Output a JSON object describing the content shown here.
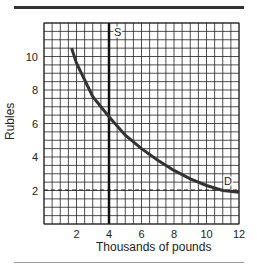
{
  "chart_data": {
    "type": "line",
    "title": "",
    "xlabel": "Thousands of pounds",
    "ylabel": "Rubles",
    "xlim": [
      0,
      12
    ],
    "ylim": [
      0,
      12
    ],
    "grid": true,
    "grid_step": 0.5,
    "x_ticks": [
      2,
      4,
      6,
      8,
      10,
      12
    ],
    "y_ticks": [
      2,
      4,
      6,
      8,
      10
    ],
    "series": [
      {
        "name": "S",
        "style": "vertical line",
        "x": [
          4,
          4
        ],
        "y": [
          0,
          12
        ]
      },
      {
        "name": "D",
        "style": "curve",
        "x": [
          1.7,
          2,
          3,
          4,
          5,
          6,
          7,
          8,
          9,
          10,
          11,
          12
        ],
        "y": [
          10.5,
          9.6,
          7.6,
          6.4,
          5.3,
          4.5,
          3.8,
          3.2,
          2.7,
          2.3,
          2.0,
          1.9
        ]
      },
      {
        "name": "price line",
        "style": "dashed",
        "x": [
          0,
          12
        ],
        "y": [
          2,
          2
        ]
      }
    ],
    "annotations": [
      {
        "text": "S",
        "x": 4.2,
        "y": 11.5
      },
      {
        "text": "D",
        "x": 11.2,
        "y": 2.4
      }
    ]
  },
  "labels": {
    "xlabel": "Thousands of pounds",
    "ylabel": "Rubles",
    "s_label": "S",
    "d_label": "D",
    "x_ticks": [
      "2",
      "4",
      "6",
      "8",
      "10",
      "12"
    ],
    "y_ticks": [
      "10",
      "8",
      "6",
      "4",
      "2"
    ]
  }
}
